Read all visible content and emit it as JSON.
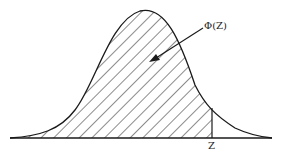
{
  "figure": {
    "type": "normal-distribution-cdf-diagram",
    "annotation_label": "Φ(Z)",
    "z_label": "Z",
    "line_color": "#1a1a1a",
    "hatch_color": "#1a1a1a",
    "background": "#ffffff"
  }
}
